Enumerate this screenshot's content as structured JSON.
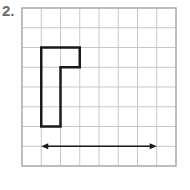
{
  "problem": {
    "label": "2."
  },
  "grid": {
    "columns": 8,
    "rows": 8,
    "line_color": "#c8c8c8",
    "border_color": "#a9a9a9"
  },
  "shape": {
    "description": "L-shaped figure outlined on grid",
    "stroke_color": "#1a1a1a",
    "vertices_grid_units": [
      [
        1,
        2
      ],
      [
        3,
        2
      ],
      [
        3,
        3
      ],
      [
        2,
        3
      ],
      [
        2,
        6
      ],
      [
        1,
        6
      ]
    ]
  },
  "arrow": {
    "description": "double-headed horizontal arrow",
    "row": 7,
    "from_col": 1,
    "to_col": 7,
    "color": "#1a1a1a"
  }
}
